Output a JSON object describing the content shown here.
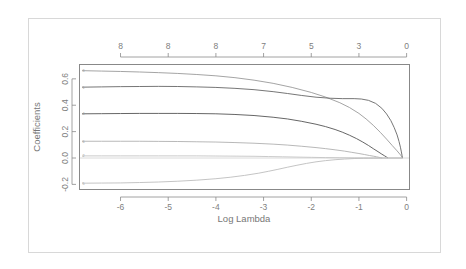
{
  "chart_data": {
    "type": "line",
    "title": "",
    "subtitle": "",
    "xlabel": "Log Lambda",
    "ylabel": "Coefficients",
    "xlim": [
      -6.85,
      0.05
    ],
    "ylim": [
      -0.235,
      0.705
    ],
    "grid": false,
    "legend": "none",
    "x_ticks": [
      {
        "value": -6,
        "label": "-6"
      },
      {
        "value": -5,
        "label": "-5"
      },
      {
        "value": -4,
        "label": "-4"
      },
      {
        "value": -3,
        "label": "-3"
      },
      {
        "value": -2,
        "label": "-2"
      },
      {
        "value": -1,
        "label": "-1"
      },
      {
        "value": 0,
        "label": "0"
      }
    ],
    "y_ticks": [
      {
        "value": 0.6,
        "label": "0.6"
      },
      {
        "value": 0.4,
        "label": "0.4"
      },
      {
        "value": 0.2,
        "label": "0.2"
      },
      {
        "value": 0.0,
        "label": "0.0"
      },
      {
        "value": -0.2,
        "label": "-0.2"
      }
    ],
    "top_axis_label": "",
    "top_ticks": [
      {
        "value": -6.0,
        "label": "8"
      },
      {
        "value": -5.0,
        "label": "8"
      },
      {
        "value": -4.0,
        "label": "8"
      },
      {
        "value": -3.0,
        "label": "7"
      },
      {
        "value": -2.0,
        "label": "5"
      },
      {
        "value": -1.0,
        "label": "3"
      },
      {
        "value": 0.0,
        "label": "0"
      }
    ],
    "series": [
      {
        "name": "v1",
        "edge_label": "3",
        "color": "#9a9a9a",
        "points": [
          [
            -6.8,
            0.662
          ],
          [
            -6.4,
            0.659
          ],
          [
            -6.0,
            0.656
          ],
          [
            -5.6,
            0.652
          ],
          [
            -5.2,
            0.647
          ],
          [
            -4.8,
            0.641
          ],
          [
            -4.4,
            0.633
          ],
          [
            -4.0,
            0.623
          ],
          [
            -3.6,
            0.609
          ],
          [
            -3.2,
            0.59
          ],
          [
            -2.8,
            0.566
          ],
          [
            -2.4,
            0.535
          ],
          [
            -2.0,
            0.497
          ],
          [
            -1.7,
            0.462
          ],
          [
            -1.4,
            0.419
          ],
          [
            -1.2,
            0.383
          ],
          [
            -1.0,
            0.338
          ],
          [
            -0.85,
            0.296
          ],
          [
            -0.7,
            0.248
          ],
          [
            -0.55,
            0.194
          ],
          [
            -0.42,
            0.143
          ],
          [
            -0.3,
            0.094
          ],
          [
            -0.2,
            0.054
          ],
          [
            -0.13,
            0.024
          ],
          [
            -0.1,
            0.01
          ],
          [
            -0.09,
            0.002
          ]
        ]
      },
      {
        "name": "v2",
        "edge_label": "1",
        "color": "#666666",
        "points": [
          [
            -6.8,
            0.537
          ],
          [
            -6.4,
            0.539
          ],
          [
            -6.0,
            0.541
          ],
          [
            -5.6,
            0.542
          ],
          [
            -5.2,
            0.543
          ],
          [
            -4.8,
            0.542
          ],
          [
            -4.4,
            0.539
          ],
          [
            -4.0,
            0.535
          ],
          [
            -3.6,
            0.528
          ],
          [
            -3.2,
            0.518
          ],
          [
            -2.8,
            0.503
          ],
          [
            -2.5,
            0.489
          ],
          [
            -2.2,
            0.474
          ],
          [
            -1.9,
            0.461
          ],
          [
            -1.6,
            0.453
          ],
          [
            -1.35,
            0.45
          ],
          [
            -1.1,
            0.45
          ],
          [
            -0.95,
            0.447
          ],
          [
            -0.8,
            0.437
          ],
          [
            -0.65,
            0.414
          ],
          [
            -0.52,
            0.377
          ],
          [
            -0.42,
            0.334
          ],
          [
            -0.33,
            0.283
          ],
          [
            -0.26,
            0.23
          ],
          [
            -0.2,
            0.175
          ],
          [
            -0.16,
            0.126
          ],
          [
            -0.13,
            0.082
          ],
          [
            -0.11,
            0.046
          ],
          [
            -0.095,
            0.018
          ],
          [
            -0.09,
            0.003
          ]
        ]
      },
      {
        "name": "v3",
        "edge_label": "4",
        "color": "#555555",
        "points": [
          [
            -6.8,
            0.335
          ],
          [
            -6.4,
            0.336
          ],
          [
            -6.0,
            0.337
          ],
          [
            -5.6,
            0.338
          ],
          [
            -5.2,
            0.338
          ],
          [
            -4.8,
            0.338
          ],
          [
            -4.4,
            0.337
          ],
          [
            -4.0,
            0.335
          ],
          [
            -3.6,
            0.33
          ],
          [
            -3.2,
            0.322
          ],
          [
            -2.8,
            0.309
          ],
          [
            -2.5,
            0.296
          ],
          [
            -2.2,
            0.278
          ],
          [
            -1.9,
            0.256
          ],
          [
            -1.7,
            0.238
          ],
          [
            -1.5,
            0.216
          ],
          [
            -1.35,
            0.196
          ],
          [
            -1.2,
            0.173
          ],
          [
            -1.05,
            0.147
          ],
          [
            -0.92,
            0.121
          ],
          [
            -0.8,
            0.095
          ],
          [
            -0.7,
            0.071
          ],
          [
            -0.6,
            0.048
          ],
          [
            -0.52,
            0.029
          ],
          [
            -0.46,
            0.016
          ],
          [
            -0.42,
            0.007
          ],
          [
            -0.4,
            0.002
          ]
        ]
      },
      {
        "name": "v4",
        "edge_label": "6",
        "color": "#b0b0b0",
        "points": [
          [
            -6.8,
            0.127
          ],
          [
            -6.4,
            0.127
          ],
          [
            -6.0,
            0.127
          ],
          [
            -5.6,
            0.127
          ],
          [
            -5.2,
            0.126
          ],
          [
            -4.8,
            0.125
          ],
          [
            -4.4,
            0.123
          ],
          [
            -4.0,
            0.121
          ],
          [
            -3.6,
            0.117
          ],
          [
            -3.2,
            0.112
          ],
          [
            -2.8,
            0.105
          ],
          [
            -2.5,
            0.098
          ],
          [
            -2.2,
            0.089
          ],
          [
            -1.9,
            0.079
          ],
          [
            -1.7,
            0.071
          ],
          [
            -1.5,
            0.062
          ],
          [
            -1.3,
            0.052
          ],
          [
            -1.15,
            0.043
          ],
          [
            -1.0,
            0.034
          ],
          [
            -0.88,
            0.026
          ],
          [
            -0.78,
            0.019
          ],
          [
            -0.7,
            0.014
          ],
          [
            -0.63,
            0.009
          ],
          [
            -0.58,
            0.005
          ],
          [
            -0.54,
            0.002
          ],
          [
            -0.52,
            0.0
          ]
        ]
      },
      {
        "name": "v5",
        "edge_label": "2",
        "color": "#c4c4c4",
        "points": [
          [
            -6.8,
            0.016
          ],
          [
            -6.4,
            0.016
          ],
          [
            -6.0,
            0.016
          ],
          [
            -5.6,
            0.016
          ],
          [
            -5.2,
            0.016
          ],
          [
            -4.8,
            0.016
          ],
          [
            -4.4,
            0.016
          ],
          [
            -4.0,
            0.015
          ],
          [
            -3.6,
            0.014
          ],
          [
            -3.2,
            0.013
          ],
          [
            -2.9,
            0.011
          ],
          [
            -2.6,
            0.009
          ],
          [
            -2.3,
            0.007
          ],
          [
            -2.0,
            0.005
          ],
          [
            -1.7,
            0.003
          ],
          [
            -1.4,
            0.002
          ],
          [
            -1.1,
            0.001
          ],
          [
            -0.8,
            0.0
          ],
          [
            -0.4,
            0.0
          ],
          [
            -0.09,
            0.0
          ]
        ]
      },
      {
        "name": "v6",
        "edge_label": "5",
        "color": "#bdbdbd",
        "points": [
          [
            -6.8,
            -0.191
          ],
          [
            -6.4,
            -0.19
          ],
          [
            -6.0,
            -0.189
          ],
          [
            -5.6,
            -0.186
          ],
          [
            -5.2,
            -0.182
          ],
          [
            -4.8,
            -0.176
          ],
          [
            -4.4,
            -0.168
          ],
          [
            -4.0,
            -0.157
          ],
          [
            -3.7,
            -0.146
          ],
          [
            -3.4,
            -0.132
          ],
          [
            -3.1,
            -0.115
          ],
          [
            -2.9,
            -0.101
          ],
          [
            -2.7,
            -0.086
          ],
          [
            -2.5,
            -0.07
          ],
          [
            -2.3,
            -0.055
          ],
          [
            -2.1,
            -0.041
          ],
          [
            -1.9,
            -0.029
          ],
          [
            -1.7,
            -0.02
          ],
          [
            -1.5,
            -0.013
          ],
          [
            -1.3,
            -0.008
          ],
          [
            -1.1,
            -0.004
          ],
          [
            -0.9,
            -0.002
          ],
          [
            -0.7,
            -0.001
          ],
          [
            -0.4,
            0.0
          ],
          [
            -0.09,
            0.0
          ]
        ]
      }
    ],
    "zero_line": {
      "value": 0.0,
      "color": "#d0d0d0"
    }
  }
}
